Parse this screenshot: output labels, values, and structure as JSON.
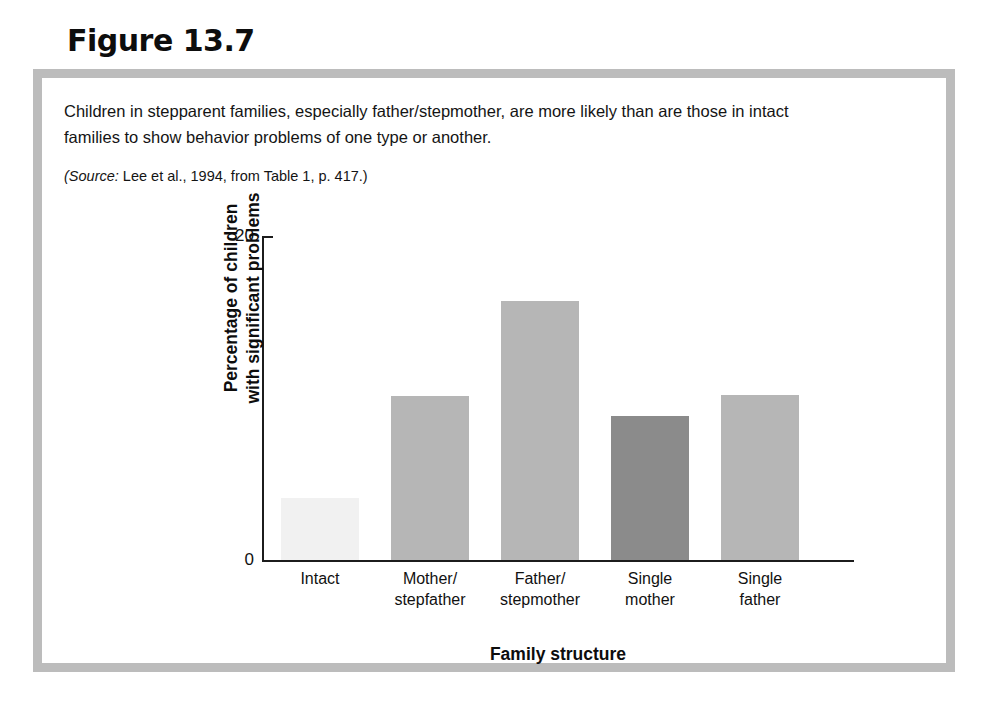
{
  "figure": {
    "number_label": "Figure 13.7",
    "caption_lines": [
      "Children in stepparent families, especially father/stepmother, are more likely than are those in intact",
      "families to show behavior problems of one type or another."
    ],
    "source_label": "(Source:",
    "source_text": " Lee et al., 1994, from Table 1, p. 417.)",
    "frame_color": "#bcbcbc"
  },
  "chart_data": {
    "type": "bar",
    "title": "",
    "subtitle": "",
    "xlabel": "Family structure",
    "ylabel": "Percentage of children with significant problems",
    "ylabel_line1": "Percentage of children",
    "ylabel_line2": "with significant problems",
    "categories": [
      "Intact",
      "Mother/stepfather",
      "Father/stepmother",
      "Single mother",
      "Single father"
    ],
    "category_lines": [
      [
        "Intact"
      ],
      [
        "Mother/",
        "stepfather"
      ],
      [
        "Father/",
        "stepmother"
      ],
      [
        "Single",
        "mother"
      ],
      [
        "Single",
        "father"
      ]
    ],
    "values": [
      3.8,
      10.1,
      16.0,
      8.9,
      10.2
    ],
    "bar_colors": [
      "#f1f1f1",
      "#b6b6b6",
      "#b6b6b6",
      "#8b8b8b",
      "#b6b6b6"
    ],
    "ylim": [
      0,
      20
    ],
    "ytick_labels": [
      "20",
      "0"
    ],
    "ytick_values": [
      20,
      0
    ],
    "grid": false,
    "legend": false,
    "legend_position": "none",
    "axis_color": "#1c1c1c"
  }
}
